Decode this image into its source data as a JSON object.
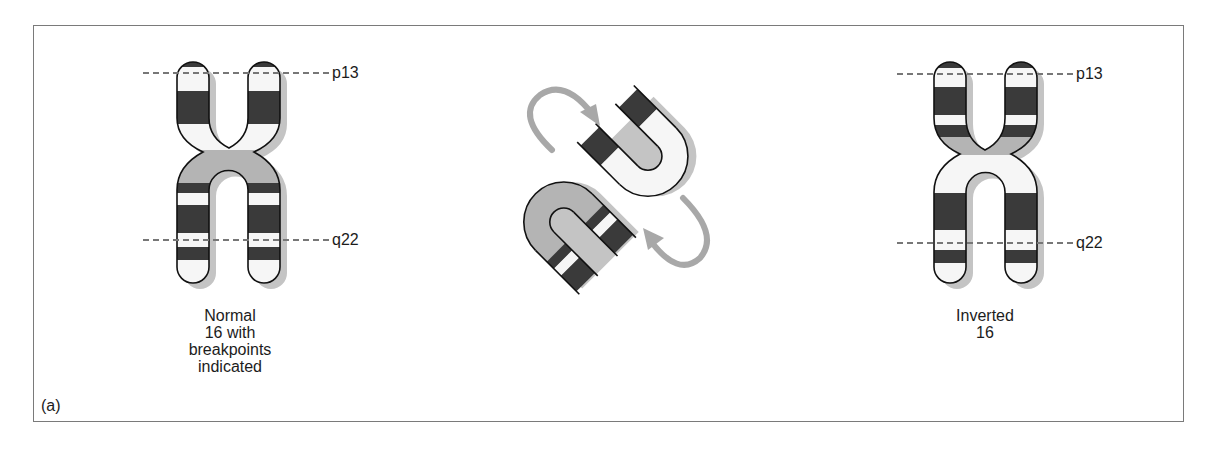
{
  "figure": {
    "panel_label": "(a)",
    "colors": {
      "dark_band": "#3a3a3a",
      "gray_band": "#b4b4b4",
      "light_band": "#f6f6f6",
      "shadow": "#c4c4c4",
      "outline": "#111111",
      "arrow": "#a8a8a8",
      "dashed_line": "#777777",
      "frame": "#7a7a7a"
    },
    "left_chromosome": {
      "caption": [
        "Normal",
        "16 with",
        "breakpoints",
        "indicated"
      ],
      "breakpoints": [
        {
          "label": "p13",
          "y": 73
        },
        {
          "label": "q22",
          "y": 240
        }
      ]
    },
    "middle_diagram": {
      "description": "inversion loop with rotating arrows"
    },
    "right_chromosome": {
      "caption": [
        "Inverted",
        "16"
      ],
      "breakpoints": [
        {
          "label": "p13",
          "y": 74
        },
        {
          "label": "q22",
          "y": 243
        }
      ]
    }
  }
}
